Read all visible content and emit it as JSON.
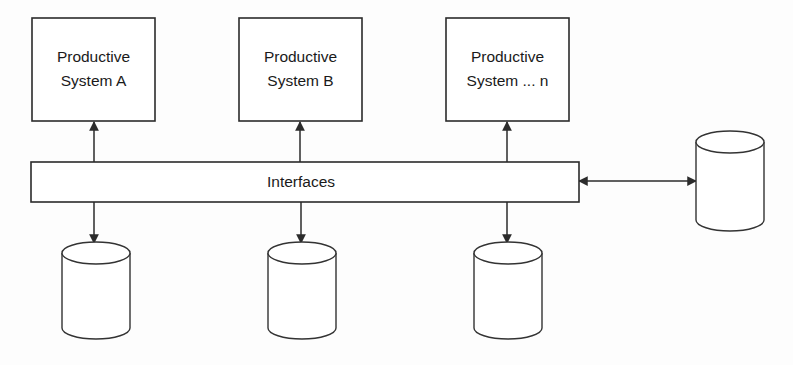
{
  "diagram": {
    "type": "system-integration-architecture",
    "background_color": "#fdfdfd",
    "line_color": "#2b2b2b",
    "fill_color": "#ffffff",
    "productive_systems": [
      {
        "id": "system-a",
        "line1": "Productive",
        "line2": "System A"
      },
      {
        "id": "system-b",
        "line1": "Productive",
        "line2": "System B"
      },
      {
        "id": "system-n",
        "line1": "Productive",
        "line2": "System ... n"
      }
    ],
    "interfaces_bar": {
      "id": "interfaces-bar",
      "label": "Interfaces"
    },
    "bottom_databases": [
      {
        "id": "database-1",
        "label": ""
      },
      {
        "id": "database-2",
        "label": ""
      },
      {
        "id": "database-3",
        "label": ""
      }
    ],
    "right_database": {
      "id": "database-external",
      "label": ""
    },
    "connections": [
      {
        "id": "conn-bar-to-system-a",
        "from": "interfaces-bar",
        "to": "system-a",
        "direction": "up",
        "arrowheads": "single"
      },
      {
        "id": "conn-bar-to-system-b",
        "from": "interfaces-bar",
        "to": "system-b",
        "direction": "up",
        "arrowheads": "single"
      },
      {
        "id": "conn-bar-to-system-n",
        "from": "interfaces-bar",
        "to": "system-n",
        "direction": "up",
        "arrowheads": "single"
      },
      {
        "id": "conn-bar-to-database-1",
        "from": "interfaces-bar",
        "to": "database-1",
        "direction": "down",
        "arrowheads": "single"
      },
      {
        "id": "conn-bar-to-database-2",
        "from": "interfaces-bar",
        "to": "database-2",
        "direction": "down",
        "arrowheads": "single"
      },
      {
        "id": "conn-bar-to-database-3",
        "from": "interfaces-bar",
        "to": "database-3",
        "direction": "down",
        "arrowheads": "single"
      },
      {
        "id": "conn-bar-to-database-external",
        "from": "interfaces-bar",
        "to": "database-external",
        "direction": "horizontal",
        "arrowheads": "double"
      }
    ]
  }
}
